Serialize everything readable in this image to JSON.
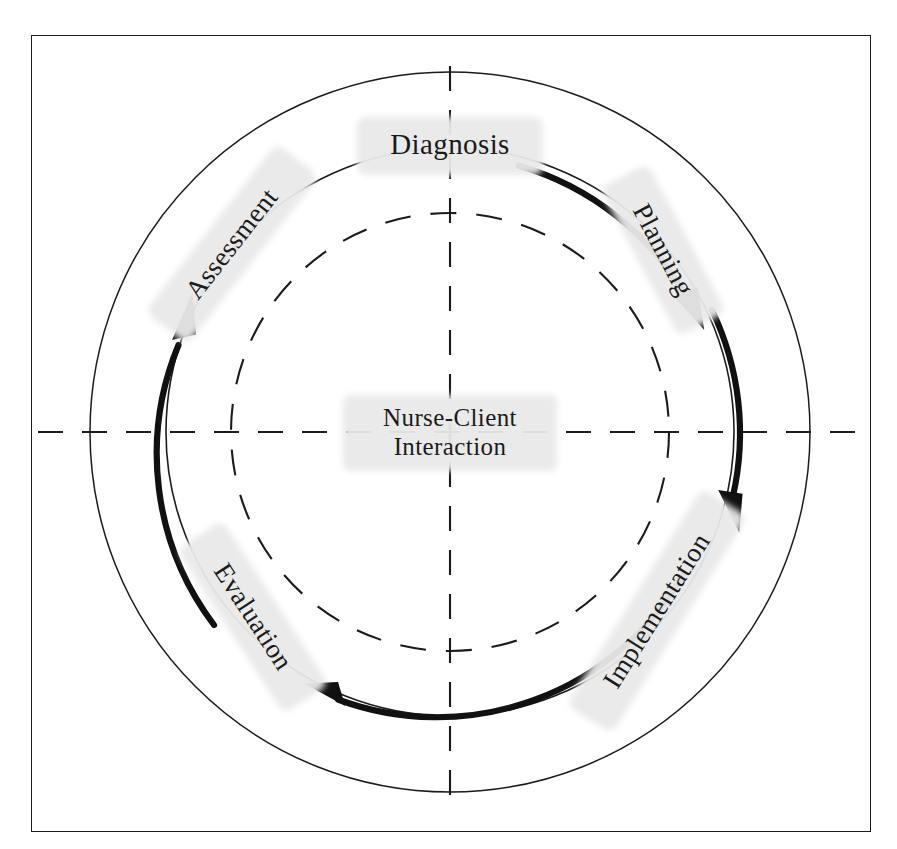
{
  "figure": {
    "center_label_line1": "Nurse-Client",
    "center_label_line2": "Interaction",
    "colors": {
      "line": "#1b1b1b",
      "arrow": "#111111",
      "highlight": "#e9e9e9",
      "background": "#ffffff",
      "frame": "#1b1b1b"
    },
    "geometry": {
      "center_x": 450,
      "center_y": 432,
      "outer_circle_radius": 360,
      "arrow_ring_radius": 284,
      "dashed_circle_radius": 219,
      "cross_line_extent": 412
    },
    "stages": [
      {
        "id": "diagnosis",
        "label": "Diagnosis",
        "position": "top",
        "angle_deg": 0,
        "rotation_deg": 0
      },
      {
        "id": "planning",
        "label": "Planning",
        "position": "upper-right",
        "angle_deg": 45,
        "rotation_deg": 62
      },
      {
        "id": "implementation",
        "label": "Implementation",
        "position": "lower-right",
        "angle_deg": 135,
        "rotation_deg": -58
      },
      {
        "id": "evaluation",
        "label": "Evaluation",
        "position": "lower-left",
        "angle_deg": 225,
        "rotation_deg": 57
      },
      {
        "id": "assessment",
        "label": "Assessment",
        "position": "upper-left",
        "angle_deg": 315,
        "rotation_deg": -52
      }
    ],
    "arrows": [
      {
        "id": "diagnosis-to-planning",
        "from": "diagnosis",
        "to": "planning",
        "direction": "clockwise",
        "head_at": "end"
      },
      {
        "id": "planning-to-implementation",
        "from": "planning",
        "to": "implementation",
        "direction": "clockwise",
        "head_at": "end"
      },
      {
        "id": "implementation-to-evaluation",
        "from": "implementation",
        "to": "evaluation",
        "direction": "clockwise",
        "head_at": "end"
      },
      {
        "id": "evaluation-to-assessment",
        "from": "evaluation",
        "to": "assessment",
        "direction": "clockwise",
        "head_at": "end"
      }
    ]
  }
}
